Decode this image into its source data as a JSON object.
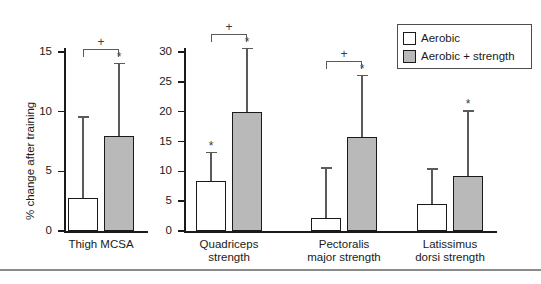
{
  "figure": {
    "ylabel": "% change after training"
  },
  "legend": {
    "items": [
      {
        "key": "aerobic",
        "label": "Aerobic",
        "color": "#ffffff"
      },
      {
        "key": "strength",
        "label": "Aerobic + strength",
        "color": "#b9b9b9"
      }
    ]
  },
  "panels": [
    {
      "id": "thigh",
      "ylim": [
        0,
        15
      ],
      "yticks": [
        0,
        5,
        10,
        15
      ],
      "ytick_labels": [
        "0",
        "5",
        "10",
        "15"
      ],
      "categories": [
        "Thigh MCSA"
      ],
      "category_lines": [
        [
          "Thigh MCSA"
        ]
      ],
      "groups": [
        {
          "category": "Thigh MCSA",
          "bars": [
            {
              "series": "Aerobic",
              "value": 2.8,
              "error": 6.8,
              "star": false
            },
            {
              "series": "Aerobic + strength",
              "value": 8.0,
              "error": 6.1,
              "star": true
            }
          ],
          "bracket_plus": "+"
        }
      ]
    },
    {
      "id": "strength-measures",
      "ylim": [
        0,
        30
      ],
      "yticks": [
        0,
        5,
        10,
        15,
        20,
        25,
        30
      ],
      "ytick_labels": [
        "0",
        "5",
        "10",
        "15",
        "20",
        "25",
        "30"
      ],
      "categories": [
        "Quadriceps strength",
        "Pectoralis major strength",
        "Latissimus dorsi strength"
      ],
      "category_lines": [
        [
          "Quadriceps",
          "strength"
        ],
        [
          "Pectoralis",
          "major strength"
        ],
        [
          "Latissimus",
          "dorsi strength"
        ]
      ],
      "groups": [
        {
          "category": "Quadriceps strength",
          "bars": [
            {
              "series": "Aerobic",
              "value": 8.3,
              "error": 5.0,
              "star": true
            },
            {
              "series": "Aerobic + strength",
              "value": 20.0,
              "error": 10.7,
              "star": true
            }
          ],
          "bracket_plus": "+"
        },
        {
          "category": "Pectoralis major strength",
          "bars": [
            {
              "series": "Aerobic",
              "value": 2.2,
              "error": 8.5,
              "star": false
            },
            {
              "series": "Aerobic + strength",
              "value": 15.7,
              "error": 10.5,
              "star": true
            }
          ],
          "bracket_plus": "+"
        },
        {
          "category": "Latissimus dorsi strength",
          "bars": [
            {
              "series": "Aerobic",
              "value": 4.5,
              "error": 6.0,
              "star": false
            },
            {
              "series": "Aerobic + strength",
              "value": 9.2,
              "error": 11.0,
              "star": true
            }
          ],
          "bracket_plus": null
        }
      ]
    }
  ],
  "chart_data": {
    "type": "bar",
    "title": "",
    "xlabel": "",
    "ylabel": "% change after training",
    "orientation": "vertical",
    "grid": false,
    "legend_position": "top-right",
    "error_bars": "upper only (SD)",
    "annotations": {
      "asterisk": "* significant within-group change",
      "plus": "+ significant between-group difference"
    },
    "panels": [
      {
        "name": "Thigh MCSA panel",
        "ylim": [
          0,
          15
        ],
        "yticks": [
          0,
          5,
          10,
          15
        ],
        "categories": [
          "Thigh MCSA"
        ],
        "series": [
          {
            "name": "Aerobic",
            "values": [
              2.8
            ],
            "errors": [
              6.8
            ],
            "sig": [
              ""
            ]
          },
          {
            "name": "Aerobic + strength",
            "values": [
              8.0
            ],
            "errors": [
              6.1
            ],
            "sig": [
              "*"
            ]
          }
        ],
        "between_group_sig": [
          "+"
        ]
      },
      {
        "name": "Strength measures panel",
        "ylim": [
          0,
          30
        ],
        "yticks": [
          0,
          5,
          10,
          15,
          20,
          25,
          30
        ],
        "categories": [
          "Quadriceps strength",
          "Pectoralis major strength",
          "Latissimus dorsi strength"
        ],
        "series": [
          {
            "name": "Aerobic",
            "values": [
              8.3,
              2.2,
              4.5
            ],
            "errors": [
              5.0,
              8.5,
              6.0
            ],
            "sig": [
              "*",
              "",
              ""
            ]
          },
          {
            "name": "Aerobic + strength",
            "values": [
              20.0,
              15.7,
              9.2
            ],
            "errors": [
              10.7,
              10.5,
              11.0
            ],
            "sig": [
              "*",
              "*",
              "*"
            ]
          }
        ],
        "between_group_sig": [
          "+",
          "+",
          ""
        ]
      }
    ]
  }
}
